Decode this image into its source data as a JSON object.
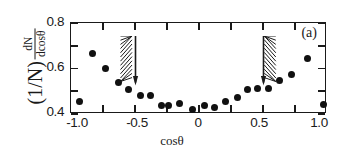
{
  "figure": {
    "panel_label": "(a)",
    "xlabel": "cosθ",
    "ylabel_prefix": "(1/N)",
    "ylabel_fraction_numerator": "dN",
    "ylabel_fraction_denominator": "dcosθ",
    "marker_color": "#111111",
    "axis_color": "#1a1a1a",
    "background_color": "#ffffff"
  },
  "chart_data": {
    "type": "scatter",
    "title": "",
    "subtitle": "",
    "panel": "(a)",
    "xlabel": "cosθ",
    "ylabel": "(1/N) dN/dcosθ",
    "xlim": [
      -1.0,
      1.0
    ],
    "ylim": [
      0.4,
      0.8
    ],
    "grid": false,
    "legend": null,
    "xticks": [
      -1.0,
      -0.5,
      0,
      0.5,
      1.0
    ],
    "xtick_labels": [
      "-1.0",
      "-0.5",
      "0",
      "0.5",
      "1.0"
    ],
    "xminorticks": [
      -0.75,
      -0.25,
      0.25,
      0.75
    ],
    "yticks": [
      0.4,
      0.6,
      0.8
    ],
    "ytick_labels": [
      "0.4",
      "0.6",
      "0.8"
    ],
    "yminorticks": [
      0.5,
      0.7
    ],
    "series": [
      {
        "name": "dN/dcosθ",
        "marker": "filled-circle",
        "x": [
          -0.93,
          -0.83,
          -0.73,
          -0.63,
          -0.55,
          -0.46,
          -0.38,
          -0.29,
          -0.24,
          -0.15,
          -0.05,
          0.04,
          0.12,
          0.21,
          0.3,
          0.38,
          0.46,
          0.54,
          0.63,
          0.72,
          0.85,
          0.97
        ],
        "y": [
          0.455,
          0.665,
          0.598,
          0.539,
          0.506,
          0.48,
          0.482,
          0.437,
          0.439,
          0.448,
          0.418,
          0.438,
          0.429,
          0.455,
          0.471,
          0.508,
          0.512,
          0.512,
          0.548,
          0.572,
          0.643,
          0.443
        ]
      }
    ],
    "annotations": [
      {
        "type": "hatched-arrow",
        "name": "left-cut-arrow",
        "x": -0.5,
        "direction": "down",
        "hatch_side": "left",
        "y_top": 0.745,
        "y_bottom": 0.545
      },
      {
        "type": "hatched-arrow",
        "name": "right-cut-arrow",
        "x": 0.5,
        "direction": "down",
        "hatch_side": "right",
        "y_top": 0.745,
        "y_bottom": 0.545
      }
    ]
  }
}
